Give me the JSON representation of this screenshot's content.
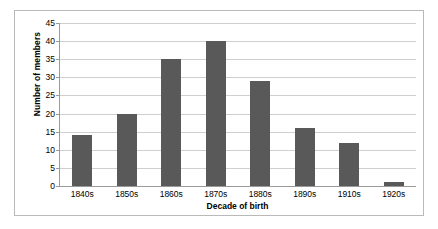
{
  "chart_data": {
    "type": "bar",
    "title": "",
    "xlabel": "Decade of birth",
    "ylabel": "Number of members",
    "categories": [
      "1840s",
      "1850s",
      "1860s",
      "1870s",
      "1880s",
      "1890s",
      "1910s",
      "1920s"
    ],
    "values": [
      14,
      20,
      35,
      40,
      29,
      16,
      12,
      1
    ],
    "ylim": [
      0,
      45
    ],
    "ytick_step": 5,
    "yticks": [
      0,
      5,
      10,
      15,
      20,
      25,
      30,
      35,
      40,
      45
    ],
    "ytick_labels": [
      "0",
      "5",
      "10",
      "15",
      "20",
      "25",
      "30",
      "35",
      "40",
      "45"
    ],
    "grid": true,
    "grid_axis": "y",
    "legend": false,
    "legend_position": "none",
    "orientation": "vertical",
    "bar_color": "#595959",
    "gridline_color": "#cfcfcf",
    "axis_color": "#9a9a9a",
    "border_color": "#b9b9b9",
    "background_color": "#ffffff"
  }
}
